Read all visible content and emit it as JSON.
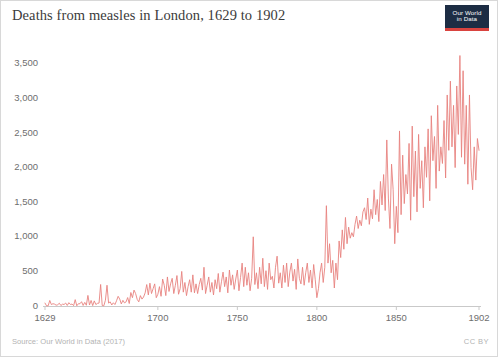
{
  "header": {
    "title": "Deaths from measles in London, 1629 to 1902",
    "logo": {
      "line1": "Our World",
      "line2": "in Data",
      "box_color": "#1d2d44",
      "accent_color": "#d9433f",
      "icon_name": "owid-logo"
    }
  },
  "footer": {
    "source": "Source: Our World in Data (2017)",
    "license": "CC BY"
  },
  "chart_data": {
    "type": "line",
    "title": "Deaths from measles in London, 1629 to 1902",
    "xlabel": "",
    "ylabel": "",
    "xlim": [
      1629,
      1902
    ],
    "ylim": [
      0,
      3700
    ],
    "grid": false,
    "legend": false,
    "line_color": "#e8827f",
    "xticks": [
      1629,
      1700,
      1750,
      1800,
      1850,
      1902
    ],
    "xtick_labels": [
      "1629",
      "1700",
      "1750",
      "1800",
      "1850",
      "1902"
    ],
    "yticks": [
      0,
      500,
      1000,
      1500,
      2000,
      2500,
      3000,
      3500
    ],
    "ytick_labels": [
      "0",
      "500",
      "1,000",
      "1,500",
      "2,000",
      "2,500",
      "3,000",
      "3,500"
    ],
    "series_name": "Deaths from measles in London",
    "x": [
      1629,
      1630,
      1631,
      1632,
      1633,
      1634,
      1635,
      1636,
      1637,
      1638,
      1639,
      1640,
      1641,
      1642,
      1643,
      1644,
      1645,
      1646,
      1647,
      1648,
      1649,
      1650,
      1651,
      1652,
      1653,
      1654,
      1655,
      1656,
      1657,
      1658,
      1659,
      1660,
      1661,
      1662,
      1663,
      1664,
      1665,
      1666,
      1667,
      1668,
      1669,
      1670,
      1671,
      1672,
      1673,
      1674,
      1675,
      1676,
      1677,
      1678,
      1679,
      1680,
      1681,
      1682,
      1683,
      1684,
      1685,
      1686,
      1687,
      1688,
      1689,
      1690,
      1691,
      1692,
      1693,
      1694,
      1695,
      1696,
      1697,
      1698,
      1699,
      1700,
      1701,
      1702,
      1703,
      1704,
      1705,
      1706,
      1707,
      1708,
      1709,
      1710,
      1711,
      1712,
      1713,
      1714,
      1715,
      1716,
      1717,
      1718,
      1719,
      1720,
      1721,
      1722,
      1723,
      1724,
      1725,
      1726,
      1727,
      1728,
      1729,
      1730,
      1731,
      1732,
      1733,
      1734,
      1735,
      1736,
      1737,
      1738,
      1739,
      1740,
      1741,
      1742,
      1743,
      1744,
      1745,
      1746,
      1747,
      1748,
      1749,
      1750,
      1751,
      1752,
      1753,
      1754,
      1755,
      1756,
      1757,
      1758,
      1759,
      1760,
      1761,
      1762,
      1763,
      1764,
      1765,
      1766,
      1767,
      1768,
      1769,
      1770,
      1771,
      1772,
      1773,
      1774,
      1775,
      1776,
      1777,
      1778,
      1779,
      1780,
      1781,
      1782,
      1783,
      1784,
      1785,
      1786,
      1787,
      1788,
      1789,
      1790,
      1791,
      1792,
      1793,
      1794,
      1795,
      1796,
      1797,
      1798,
      1799,
      1800,
      1801,
      1802,
      1803,
      1804,
      1805,
      1806,
      1807,
      1808,
      1809,
      1810,
      1811,
      1812,
      1813,
      1814,
      1815,
      1816,
      1817,
      1818,
      1819,
      1820,
      1821,
      1822,
      1823,
      1824,
      1825,
      1826,
      1827,
      1828,
      1829,
      1830,
      1831,
      1832,
      1833,
      1834,
      1835,
      1836,
      1837,
      1838,
      1839,
      1840,
      1841,
      1842,
      1843,
      1844,
      1845,
      1846,
      1847,
      1848,
      1849,
      1850,
      1851,
      1852,
      1853,
      1854,
      1855,
      1856,
      1857,
      1858,
      1859,
      1860,
      1861,
      1862,
      1863,
      1864,
      1865,
      1866,
      1867,
      1868,
      1869,
      1870,
      1871,
      1872,
      1873,
      1874,
      1875,
      1876,
      1877,
      1878,
      1879,
      1880,
      1881,
      1882,
      1883,
      1884,
      1885,
      1886,
      1887,
      1888,
      1889,
      1890,
      1891,
      1892,
      1893,
      1894,
      1895,
      1896,
      1897,
      1898,
      1899,
      1900,
      1901,
      1902
    ],
    "values": [
      42,
      2,
      3,
      80,
      21,
      33,
      27,
      12,
      18,
      40,
      7,
      26,
      22,
      43,
      8,
      48,
      22,
      28,
      5,
      92,
      3,
      33,
      33,
      62,
      8,
      52,
      11,
      153,
      15,
      80,
      6,
      74,
      21,
      38,
      42,
      311,
      7,
      3,
      83,
      300,
      42,
      60,
      15,
      47,
      21,
      76,
      140,
      100,
      30,
      82,
      45,
      60,
      122,
      36,
      195,
      120,
      230,
      180,
      95,
      60,
      150,
      100,
      130,
      190,
      310,
      160,
      330,
      180,
      250,
      320,
      120,
      170,
      280,
      140,
      390,
      300,
      150,
      420,
      210,
      320,
      400,
      180,
      300,
      440,
      170,
      250,
      500,
      200,
      340,
      150,
      280,
      380,
      200,
      450,
      190,
      320,
      180,
      310,
      400,
      230,
      560,
      180,
      300,
      420,
      200,
      340,
      160,
      380,
      250,
      470,
      200,
      350,
      490,
      280,
      420,
      190,
      520,
      300,
      450,
      240,
      390,
      520,
      220,
      410,
      620,
      280,
      560,
      300,
      480,
      220,
      400,
      1000,
      310,
      480,
      250,
      560,
      320,
      690,
      280,
      510,
      240,
      620,
      380,
      430,
      260,
      560,
      720,
      330,
      480,
      260,
      590,
      340,
      620,
      280,
      490,
      620,
      360,
      530,
      240,
      680,
      400,
      320,
      560,
      300,
      480,
      620,
      340,
      520,
      260,
      600,
      380,
      120,
      250,
      480,
      620,
      340,
      560,
      1450,
      620,
      900,
      480,
      660,
      260,
      620,
      380,
      940,
      700,
      1100,
      820,
      1280,
      900,
      1140,
      980,
      1060,
      1000,
      1180,
      1300,
      1120,
      1240,
      1160,
      1360,
      1420,
      1250,
      1560,
      1180,
      1400,
      1260,
      1680,
      1320,
      1540,
      1220,
      1800,
      1460,
      1900,
      1380,
      2400,
      1560,
      1120,
      2050,
      1680,
      900,
      1440,
      1060,
      2530,
      1320,
      2180,
      1480,
      1900,
      1620,
      2350,
      1240,
      2600,
      1580,
      2240,
      1360,
      2480,
      1700,
      2100,
      1420,
      2300,
      1860,
      2560,
      1520,
      2750,
      2100,
      2450,
      1700,
      2900,
      1950,
      2300,
      2060,
      2680,
      1850,
      3050,
      2250,
      3250,
      2300,
      2900,
      2000,
      3180,
      2480,
      3620,
      2150,
      3400,
      2050,
      2900,
      1760,
      3050,
      2000,
      1680,
      2300,
      1820,
      2420,
      2250
    ]
  }
}
